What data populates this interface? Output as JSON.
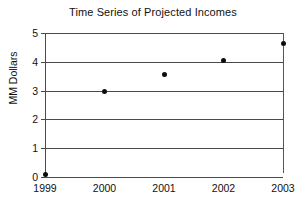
{
  "chart_data": {
    "type": "scatter",
    "title": "Time Series of Projected Incomes",
    "xlabel": "",
    "ylabel": "MM Dollars",
    "categories": [
      "1999",
      "2000",
      "2001",
      "2002",
      "2003"
    ],
    "x": [
      1999,
      2000,
      2001,
      2002,
      2003
    ],
    "values": [
      0.07,
      2.98,
      3.55,
      4.05,
      4.65
    ],
    "error_bars": [
      null,
      null,
      null,
      null,
      {
        "low": 0.15,
        "high": 5.0
      }
    ],
    "ylim": [
      0,
      5
    ],
    "yticks": [
      0,
      1,
      2,
      3,
      4,
      5
    ],
    "ytick_labels": [
      "0",
      "1",
      "2",
      "3",
      "4",
      "5"
    ],
    "xtick_labels": [
      "1999",
      "2000",
      "2001",
      "2002",
      "2003"
    ],
    "grid": true,
    "grid_axis": "y",
    "legend": false,
    "marker": "filled-circle",
    "marker_color": "#0d0d0d",
    "axis_color": "#4a4a4a",
    "background": "#ffffff"
  }
}
